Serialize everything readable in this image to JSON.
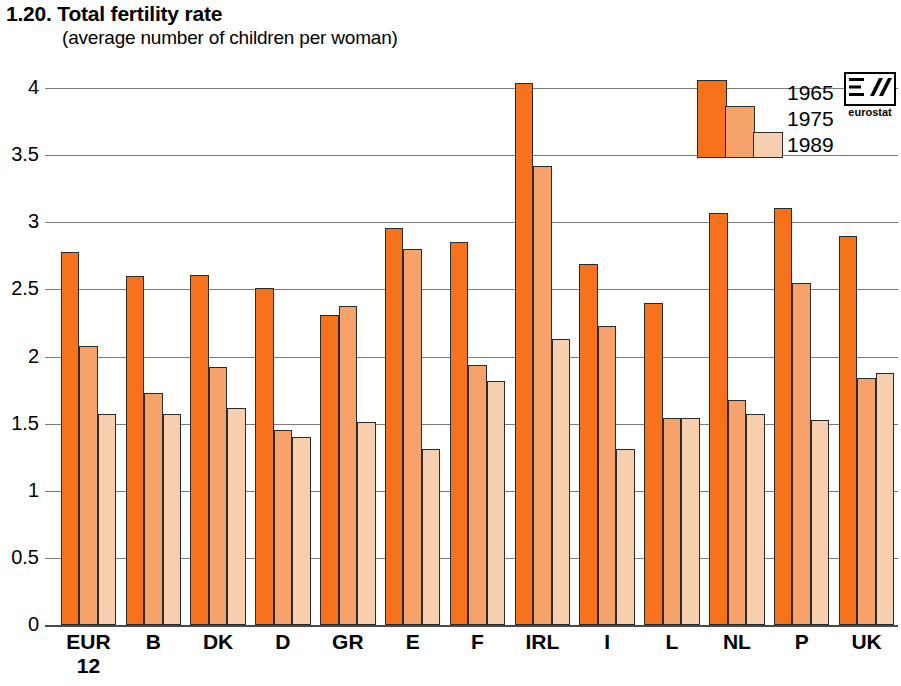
{
  "chart_data": {
    "type": "bar",
    "title": "1.20.  Total fertility rate",
    "title_number": "1.20.",
    "title_text": "Total fertility rate",
    "subtitle": "(average number of children per woman)",
    "xlabel": "",
    "ylabel": "",
    "ylim": [
      0,
      4.15
    ],
    "yticks": [
      "0",
      "0.5",
      "1",
      "1.5",
      "2",
      "2.5",
      "3",
      "3.5",
      "4"
    ],
    "ytick_values": [
      0,
      0.5,
      1,
      1.5,
      2,
      2.5,
      3,
      3.5,
      4
    ],
    "grid": true,
    "legend_position": "top-right",
    "categories": [
      "EUR 12",
      "B",
      "DK",
      "D",
      "GR",
      "E",
      "F",
      "IRL",
      "I",
      "L",
      "NL",
      "P",
      "UK"
    ],
    "category_lines": [
      [
        "EUR",
        "12"
      ],
      [
        "B"
      ],
      [
        "DK"
      ],
      [
        "D"
      ],
      [
        "GR"
      ],
      [
        "E"
      ],
      [
        "F"
      ],
      [
        "IRL"
      ],
      [
        "I"
      ],
      [
        "L"
      ],
      [
        "NL"
      ],
      [
        "P"
      ],
      [
        "UK"
      ]
    ],
    "series": [
      {
        "name": "1965",
        "color": "#f7721d",
        "values": [
          2.78,
          2.6,
          2.61,
          2.51,
          2.31,
          2.96,
          2.85,
          4.04,
          2.69,
          2.4,
          3.07,
          3.11,
          2.9
        ]
      },
      {
        "name": "1975",
        "color": "#f5a36b",
        "values": [
          2.08,
          1.73,
          1.92,
          1.45,
          2.38,
          2.8,
          1.94,
          3.42,
          2.23,
          1.54,
          1.68,
          2.55,
          1.84
        ]
      },
      {
        "name": "1989",
        "color": "#f7cfae",
        "values": [
          1.57,
          1.57,
          1.62,
          1.4,
          1.51,
          1.31,
          1.82,
          2.13,
          1.31,
          1.54,
          1.57,
          1.53,
          1.88
        ]
      }
    ]
  },
  "legend": {
    "entries": [
      "1965",
      "1975",
      "1989"
    ]
  },
  "logo": {
    "name": "eurostat",
    "wordmark": "eurostat"
  }
}
